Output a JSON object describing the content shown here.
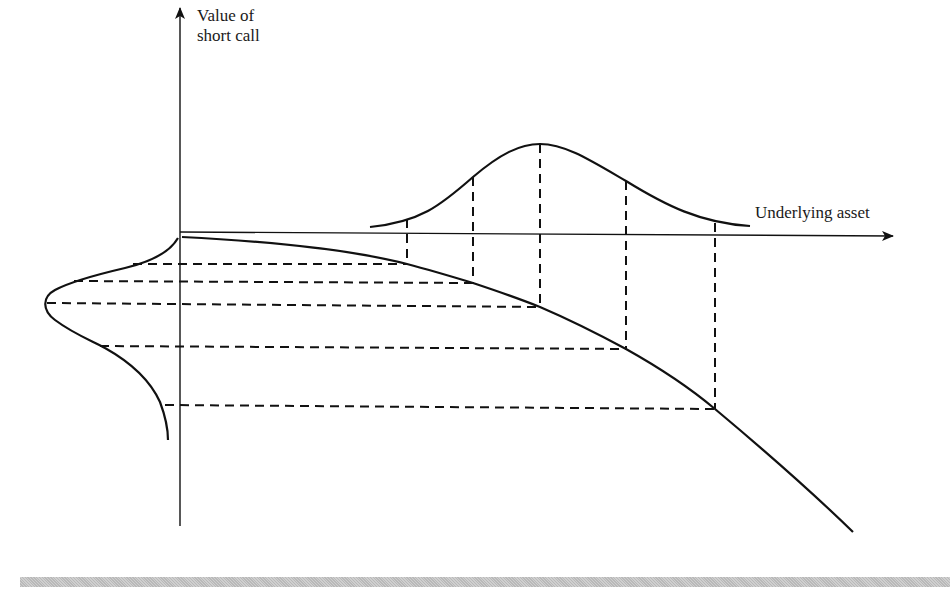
{
  "figure": {
    "y_axis_label": "Value of\nshort call",
    "y_axis_label_line1": "Value of",
    "y_axis_label_line2": "short call",
    "x_axis_label": "Underlying asset",
    "colors": {
      "ink": "#111111",
      "background": "#ffffff",
      "footer_bar": "#c4c4c4"
    }
  },
  "elements": {
    "underlying_distribution": "bell-shaped distribution of the underlying asset price above the horizontal axis",
    "value_curve": "concave decreasing value of short call as a function of the underlying asset",
    "value_distribution": "skewed distribution of short call value drawn to the left of the vertical axis",
    "projection_lines": "dashed lines mapping 5 underlying asset points through the value curve to the value axis",
    "projection_count": 5
  }
}
